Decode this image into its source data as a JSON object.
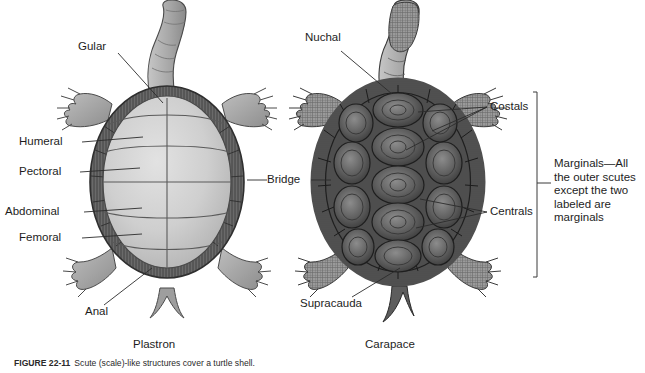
{
  "figure": {
    "caption_number": "FIGURE 22-11",
    "caption_text": "Scute (scale)-like structures cover a turtle shell."
  },
  "panels": [
    {
      "id": "plastron",
      "name": "Plastron",
      "title": "Plastron"
    },
    {
      "id": "carapace",
      "name": "Carapace",
      "title": "Carapace"
    }
  ],
  "plastron_labels": {
    "gular": "Gular",
    "humeral": "Humeral",
    "pectoral": "Pectoral",
    "abdominal": "Abdominal",
    "femoral": "Femoral",
    "anal": "Anal",
    "caption": "Plastron"
  },
  "shared_labels": {
    "bridge": "Bridge"
  },
  "carapace_labels": {
    "nuchal": "Nuchal",
    "costals": "Costals",
    "centrals": "Centrals",
    "supracauda": "Supracauda",
    "caption": "Carapace",
    "marginals": "Marginals—All\nthe outer scutes\nexcept the two\nlabeled are\nmarginals"
  },
  "colors": {
    "ink": "#1d1d1d",
    "leader": "#2b2b2b",
    "plastron_fill_light": "#d5d5d5",
    "plastron_fill_mid": "#bdbdbd",
    "rim_dark": "#5a5a5a",
    "carapace_dark": "#4a4a4a",
    "carapace_mid": "#6e6e6e",
    "limb_gray": "#a9a9a9",
    "background": "#ffffff"
  }
}
